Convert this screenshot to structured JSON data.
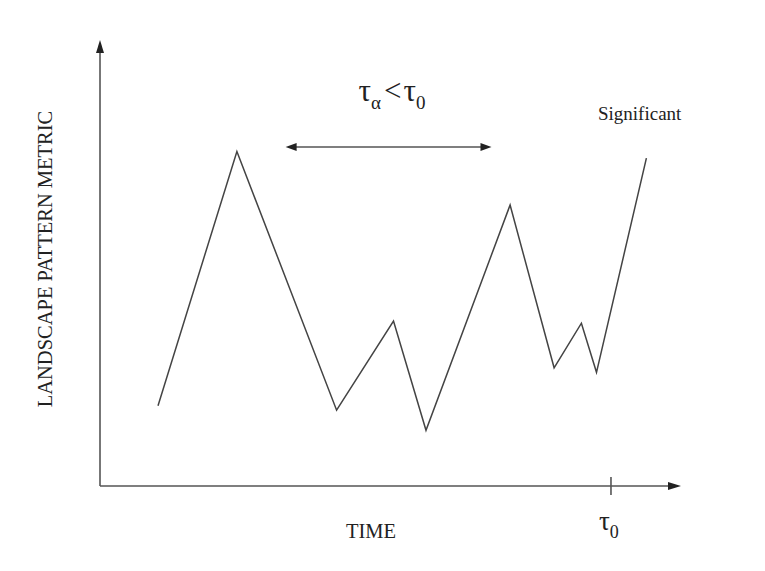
{
  "chart_data": {
    "type": "line",
    "title": "",
    "xlabel": "TIME",
    "ylabel": "LANDSCAPE PATTERN METRIC",
    "xlim": [
      0,
      100
    ],
    "ylim": [
      0,
      100
    ],
    "grid": false,
    "legend": null,
    "series": [
      {
        "name": "metric",
        "color": "#444444",
        "x": [
          10,
          23.6,
          40.8,
          50.6,
          56.2,
          70.7,
          78.3,
          83.0,
          85.6,
          94.2
        ],
        "y": [
          18,
          75,
          17,
          37,
          12.5,
          63,
          26.5,
          36.5,
          25.5,
          73.5
        ]
      }
    ],
    "x_ticks": [
      {
        "x": 88.1,
        "label_base": "τ",
        "label_sub": "0"
      }
    ],
    "annotations": [
      {
        "id": "interval",
        "kind": "double-arrow",
        "x_start": 32,
        "x_end": 67.5,
        "y": 76,
        "label_base1": "τ",
        "label_sub1": "α",
        "label_op": "<",
        "label_base2": "τ",
        "label_sub2": "0"
      },
      {
        "id": "significant",
        "kind": "text",
        "text": "Significant"
      }
    ]
  }
}
